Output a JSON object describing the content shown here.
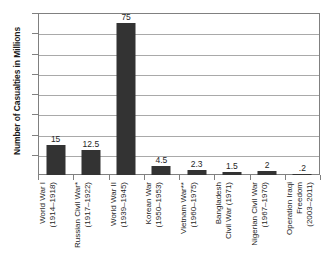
{
  "chart_data": {
    "type": "bar",
    "title": "",
    "xlabel": "",
    "ylabel": "Number of Casualties in Millions",
    "ylim": [
      0,
      80
    ],
    "ytick_step": 10,
    "yticks": [
      "80",
      "70",
      "60",
      "50",
      "40",
      "30",
      "20",
      "10"
    ],
    "ytick_values": [
      80,
      70,
      60,
      50,
      40,
      30,
      20,
      10
    ],
    "grid": true,
    "legend": false,
    "bar_color": "#333333",
    "categories": [
      "World War I (1914–1918)",
      "Russian Civil War* (1917–1922)",
      "World War II (1939–1945)",
      "Korean War (1950–1953)",
      "Vietnam War** (1960–1975)",
      "Bangladesh Civil War (1971)",
      "Nigerian Civil War (1967–1970)",
      "Operation Iraqi Freedom (2003–2011)"
    ],
    "category_lines": [
      [
        "World War I",
        "(1914–1918)"
      ],
      [
        "Russian Civil War*",
        "(1917–1922)"
      ],
      [
        "World War II",
        "(1939–1945)"
      ],
      [
        "Korean War",
        "(1950–1953)"
      ],
      [
        "Vietnam War**",
        "(1960–1975)"
      ],
      [
        "Bangladesh",
        "Civil War (1971)"
      ],
      [
        "Nigerian Civil War",
        "(1967–1970)"
      ],
      [
        "Operation Iraqi",
        "Freedom",
        "(2003–2011)"
      ]
    ],
    "values": [
      15,
      12.5,
      75,
      4.5,
      2.3,
      1.5,
      2,
      0.2
    ],
    "value_labels": [
      "15",
      "12.5",
      "75",
      "4.5",
      "2.3",
      "1.5",
      "2",
      ".2"
    ]
  }
}
